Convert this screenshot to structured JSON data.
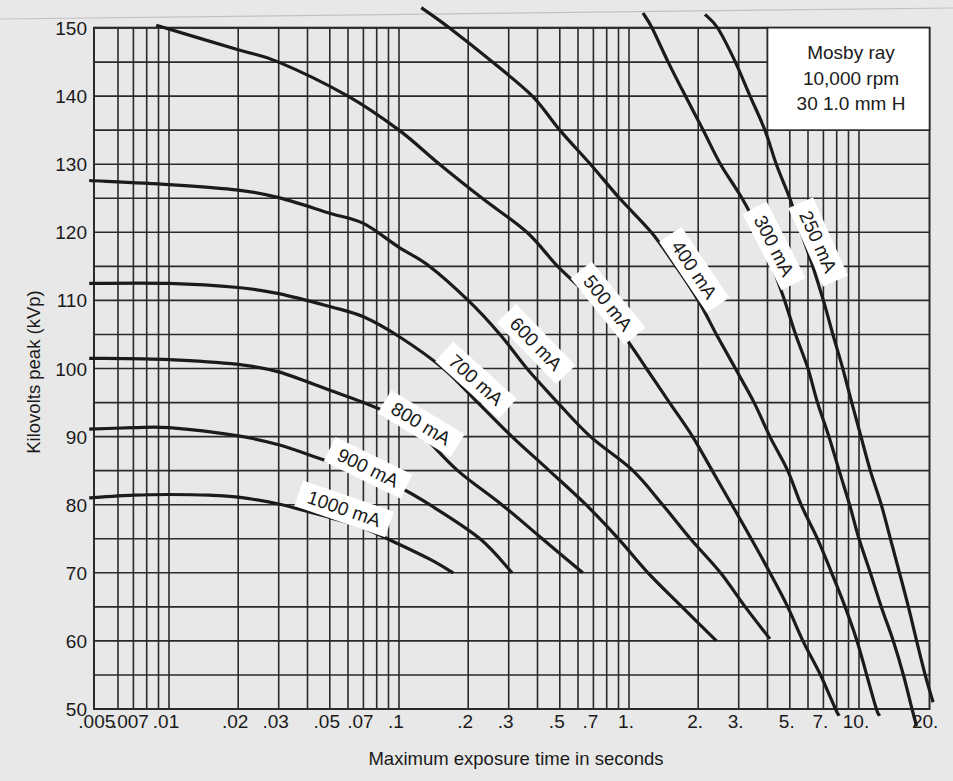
{
  "chart_data": {
    "type": "line",
    "title": "",
    "xlabel": "Maximum exposure time in seconds",
    "ylabel": "Kilovolts peak (kVp)",
    "x_scale": "log",
    "xlim": [
      0.005,
      20
    ],
    "ylim": [
      50,
      150
    ],
    "grid": true,
    "y_grid_step": 5,
    "y_ticks": [
      50,
      60,
      70,
      80,
      90,
      100,
      110,
      120,
      130,
      140,
      150
    ],
    "x_ticks": [
      {
        "value": 0.005,
        "label": ".005"
      },
      {
        "value": 0.007,
        "label": ".007"
      },
      {
        "value": 0.01,
        "label": ".01"
      },
      {
        "value": 0.02,
        "label": ".02"
      },
      {
        "value": 0.03,
        "label": ".03"
      },
      {
        "value": 0.05,
        "label": ".05"
      },
      {
        "value": 0.07,
        "label": ".07"
      },
      {
        "value": 0.1,
        "label": ".1"
      },
      {
        "value": 0.2,
        "label": ".2"
      },
      {
        "value": 0.3,
        "label": ".3"
      },
      {
        "value": 0.5,
        "label": ".5"
      },
      {
        "value": 0.7,
        "label": ".7"
      },
      {
        "value": 1,
        "label": "1."
      },
      {
        "value": 2,
        "label": "2."
      },
      {
        "value": 3,
        "label": "3."
      },
      {
        "value": 5,
        "label": "5."
      },
      {
        "value": 7,
        "label": "7."
      },
      {
        "value": 10,
        "label": "10."
      },
      {
        "value": 20,
        "label": "20."
      }
    ],
    "x_gridlines": [
      0.006,
      0.007,
      0.008,
      0.009,
      0.01,
      0.02,
      0.03,
      0.04,
      0.05,
      0.06,
      0.07,
      0.08,
      0.09,
      0.1,
      0.2,
      0.3,
      0.4,
      0.5,
      0.6,
      0.7,
      0.8,
      0.9,
      1,
      2,
      3,
      4,
      5,
      6,
      7,
      8,
      9,
      10
    ],
    "annotation_box": {
      "position": "top-right",
      "lines": [
        "Mosby ray",
        "10,000 rpm",
        "30 1.0 mm H"
      ]
    },
    "series": [
      {
        "name": "1000 mA",
        "label_at": [
          0.0577,
          79.4
        ],
        "label_angle": 19,
        "points": [
          [
            0.0045,
            81.0
          ],
          [
            0.007,
            81.4
          ],
          [
            0.01,
            81.5
          ],
          [
            0.015,
            81.4
          ],
          [
            0.02,
            81.1
          ],
          [
            0.03,
            80.1
          ],
          [
            0.05,
            78.1
          ],
          [
            0.07,
            76.6
          ],
          [
            0.1,
            74.2
          ],
          [
            0.136,
            72.0
          ],
          [
            0.172,
            70.0
          ]
        ]
      },
      {
        "name": "900 mA",
        "label_at": [
          0.0733,
          85.4
        ],
        "label_angle": 26,
        "points": [
          [
            0.0045,
            91.1
          ],
          [
            0.007,
            91.3
          ],
          [
            0.01,
            91.3
          ],
          [
            0.02,
            90.1
          ],
          [
            0.03,
            88.8
          ],
          [
            0.05,
            86.3
          ],
          [
            0.07,
            84.9
          ],
          [
            0.1,
            82.6
          ],
          [
            0.136,
            80.0
          ],
          [
            0.225,
            75.0
          ],
          [
            0.31,
            70.0
          ]
        ]
      },
      {
        "name": "800 mA",
        "label_at": [
          0.1247,
          91.9
        ],
        "label_angle": 31,
        "points": [
          [
            0.0045,
            101.5
          ],
          [
            0.01,
            101.3
          ],
          [
            0.02,
            100.6
          ],
          [
            0.03,
            99.5
          ],
          [
            0.05,
            96.8
          ],
          [
            0.07,
            95.0
          ],
          [
            0.1,
            92.7
          ],
          [
            0.128,
            90.0
          ],
          [
            0.18,
            85.0
          ],
          [
            0.28,
            80.0
          ],
          [
            0.42,
            75.0
          ],
          [
            0.63,
            70.0
          ]
        ]
      },
      {
        "name": "700 mA",
        "label_at": [
          0.216,
          98.3
        ],
        "label_angle": 42,
        "points": [
          [
            0.0045,
            112.5
          ],
          [
            0.01,
            112.5
          ],
          [
            0.02,
            111.9
          ],
          [
            0.03,
            111.0
          ],
          [
            0.05,
            109.1
          ],
          [
            0.07,
            107.6
          ],
          [
            0.1,
            104.7
          ],
          [
            0.156,
            100.0
          ],
          [
            0.22,
            95.0
          ],
          [
            0.31,
            90.0
          ],
          [
            0.45,
            85.0
          ],
          [
            0.65,
            80.0
          ],
          [
            0.9,
            75.0
          ],
          [
            1.21,
            70.0
          ],
          [
            1.7,
            65.0
          ],
          [
            2.4,
            60.0
          ]
        ]
      },
      {
        "name": "600 mA",
        "label_at": [
          0.394,
          103.6
        ],
        "label_angle": 46,
        "points": [
          [
            0.0045,
            127.6
          ],
          [
            0.01,
            127.0
          ],
          [
            0.02,
            126.2
          ],
          [
            0.03,
            125.1
          ],
          [
            0.05,
            122.8
          ],
          [
            0.07,
            121.3
          ],
          [
            0.1,
            117.8
          ],
          [
            0.136,
            115.0
          ],
          [
            0.2,
            110.0
          ],
          [
            0.275,
            105.0
          ],
          [
            0.36,
            100.0
          ],
          [
            0.49,
            95.0
          ],
          [
            0.68,
            90.0
          ],
          [
            1.04,
            85.0
          ],
          [
            1.4,
            80.0
          ],
          [
            1.85,
            75.0
          ],
          [
            2.5,
            70.0
          ],
          [
            3.2,
            65.0
          ],
          [
            4.1,
            60.3
          ]
        ]
      },
      {
        "name": "500 mA",
        "label_at": [
          0.81,
          109.6
        ],
        "label_angle": 51,
        "points": [
          [
            0.0088,
            150.4
          ],
          [
            0.02,
            146.8
          ],
          [
            0.03,
            145.0
          ],
          [
            0.06,
            140.0
          ],
          [
            0.1,
            135.0
          ],
          [
            0.15,
            130.0
          ],
          [
            0.23,
            125.0
          ],
          [
            0.36,
            120.0
          ],
          [
            0.49,
            115.0
          ],
          [
            0.7,
            110.0
          ],
          [
            0.94,
            105.0
          ],
          [
            1.19,
            100.0
          ],
          [
            1.5,
            95.0
          ],
          [
            1.89,
            90.0
          ],
          [
            2.3,
            85.0
          ],
          [
            2.8,
            80.0
          ],
          [
            3.4,
            75.0
          ],
          [
            4.1,
            70.0
          ],
          [
            4.9,
            65.0
          ],
          [
            5.7,
            60.0
          ],
          [
            6.8,
            55.0
          ],
          [
            7.9,
            50.0
          ],
          [
            8.2,
            49.0
          ]
        ]
      },
      {
        "name": "400 mA",
        "label_at": [
          1.92,
          114.5
        ],
        "label_angle": 56,
        "points": [
          [
            0.125,
            153.0
          ],
          [
            0.166,
            150.0
          ],
          [
            0.255,
            145.0
          ],
          [
            0.38,
            140.0
          ],
          [
            0.5,
            135.0
          ],
          [
            0.68,
            130.0
          ],
          [
            0.91,
            125.0
          ],
          [
            1.25,
            120.0
          ],
          [
            1.6,
            115.0
          ],
          [
            2.0,
            110.0
          ],
          [
            2.4,
            105.0
          ],
          [
            2.9,
            100.0
          ],
          [
            3.5,
            95.0
          ],
          [
            4.1,
            90.0
          ],
          [
            4.9,
            85.0
          ],
          [
            5.6,
            80.0
          ],
          [
            6.6,
            75.0
          ],
          [
            7.6,
            70.0
          ],
          [
            8.7,
            65.0
          ],
          [
            9.8,
            60.0
          ],
          [
            10.8,
            55.0
          ],
          [
            11.9,
            50.0
          ],
          [
            12.3,
            49.0
          ]
        ]
      },
      {
        "name": "300 mA",
        "label_at": [
          4.27,
          118.0
        ],
        "label_angle": 63,
        "points": [
          [
            1.15,
            152.2
          ],
          [
            1.26,
            150.0
          ],
          [
            1.48,
            145.0
          ],
          [
            1.76,
            140.0
          ],
          [
            2.1,
            135.0
          ],
          [
            2.5,
            130.0
          ],
          [
            3.1,
            125.0
          ],
          [
            3.7,
            120.0
          ],
          [
            4.2,
            115.0
          ],
          [
            4.75,
            110.0
          ],
          [
            5.3,
            105.0
          ],
          [
            6.0,
            100.0
          ],
          [
            6.6,
            95.0
          ],
          [
            7.4,
            90.0
          ],
          [
            8.2,
            85.0
          ],
          [
            9.1,
            80.0
          ],
          [
            10.0,
            75.0
          ],
          [
            11.2,
            70.0
          ],
          [
            12.5,
            65.0
          ],
          [
            14.1,
            60.0
          ],
          [
            15.6,
            55.0
          ],
          [
            17.0,
            50.0
          ],
          [
            17.8,
            47.5
          ]
        ]
      },
      {
        "name": "250 mA",
        "label_at": [
          6.64,
          118.6
        ],
        "label_angle": 66,
        "points": [
          [
            2.14,
            152.0
          ],
          [
            2.43,
            150.0
          ],
          [
            2.9,
            145.0
          ],
          [
            3.36,
            140.0
          ],
          [
            3.9,
            135.0
          ],
          [
            4.37,
            130.0
          ],
          [
            5.0,
            125.0
          ],
          [
            5.6,
            120.0
          ],
          [
            6.3,
            115.0
          ],
          [
            7.0,
            110.0
          ],
          [
            7.7,
            105.0
          ],
          [
            8.5,
            100.0
          ],
          [
            9.3,
            95.0
          ],
          [
            10.2,
            90.0
          ],
          [
            11.2,
            85.0
          ],
          [
            12.5,
            80.0
          ],
          [
            13.7,
            75.0
          ],
          [
            15.0,
            70.0
          ],
          [
            16.4,
            65.0
          ],
          [
            17.8,
            60.0
          ],
          [
            19.4,
            55.0
          ],
          [
            21.0,
            51.0
          ]
        ]
      }
    ]
  },
  "colors": {
    "background": "#e8e8e8",
    "grid": "#2a2a2a",
    "curve": "#1b1b1b",
    "label_box": "#ffffff",
    "page_edge": "#c2c2c2"
  }
}
